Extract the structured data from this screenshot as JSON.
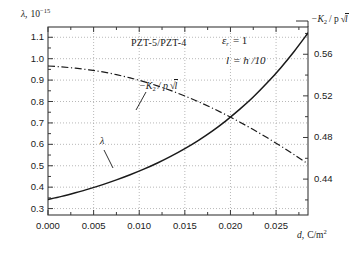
{
  "chart_data": {
    "type": "line",
    "title": "PZT-5/PZT-4",
    "annotations": {
      "material": "PZT-5/PZT-4",
      "param_epsilon": "ε",
      "param_epsilon_sub": "r",
      "param_epsilon_val": "= 1",
      "param_l": "l",
      "param_l_val": "= h /10",
      "curve_label_lambda": "λ",
      "curve_label_k2": "−K",
      "curve_label_k2_sub": "2",
      "curve_label_k2_rest": "/ p",
      "curve_label_k2_sqrt": "l"
    },
    "xlabel_main": "d,",
    "xlabel_unit": "C/m",
    "xlabel_unit_sup": "2",
    "xlim": [
      0.0,
      0.0285
    ],
    "xticks": [
      0.0,
      0.005,
      0.01,
      0.015,
      0.02,
      0.025
    ],
    "xtick_labels": [
      "0.000",
      "0.005",
      "0.010",
      "0.015",
      "0.020",
      "0.025"
    ],
    "left_axis": {
      "label_symbol": "λ,",
      "label_scale_base": "10",
      "label_scale_exp": "−15",
      "ylim": [
        0.27,
        1.148
      ],
      "ticks": [
        0.3,
        0.4,
        0.5,
        0.6,
        0.7,
        0.8,
        0.9,
        1.0,
        1.1
      ],
      "tick_labels": [
        "0.3",
        "0.4",
        "0.5",
        "0.6",
        "0.7",
        "0.8",
        "0.9",
        "1.0",
        "1.1"
      ]
    },
    "right_axis": {
      "label_prefix": "−K",
      "label_sub": "2",
      "label_mid": "/ p",
      "label_sqrt": "l",
      "ylim": [
        0.4055,
        0.5862
      ],
      "ticks": [
        0.44,
        0.48,
        0.52,
        0.56
      ],
      "tick_labels": [
        "0.44",
        "0.48",
        "0.52",
        "0.56"
      ]
    },
    "grid": true,
    "legend_position": "inline-annotations",
    "series": [
      {
        "name": "lambda",
        "axis": "left",
        "style": "solid",
        "color": "#1a1a1a",
        "x": [
          0.0,
          0.0015,
          0.003,
          0.0045,
          0.006,
          0.0075,
          0.009,
          0.0105,
          0.012,
          0.0135,
          0.015,
          0.0165,
          0.018,
          0.0195,
          0.021,
          0.0225,
          0.024,
          0.0255,
          0.027,
          0.0285
        ],
        "y": [
          0.342,
          0.357,
          0.374,
          0.392,
          0.412,
          0.434,
          0.458,
          0.484,
          0.513,
          0.545,
          0.58,
          0.619,
          0.662,
          0.71,
          0.763,
          0.821,
          0.886,
          0.957,
          1.035,
          1.12
        ]
      },
      {
        "name": "minus_K2_over_p_sqrt_l",
        "axis": "right",
        "style": "dashdot",
        "color": "#1a1a1a",
        "x": [
          0.0,
          0.0015,
          0.003,
          0.0045,
          0.006,
          0.0075,
          0.009,
          0.0105,
          0.012,
          0.0135,
          0.015,
          0.0165,
          0.018,
          0.0195,
          0.021,
          0.0225,
          0.024,
          0.0255,
          0.027,
          0.0285
        ],
        "y": [
          0.5487,
          0.5478,
          0.5466,
          0.545,
          0.543,
          0.5404,
          0.5373,
          0.5337,
          0.5296,
          0.525,
          0.5199,
          0.5143,
          0.5083,
          0.5018,
          0.4949,
          0.4876,
          0.4799,
          0.4718,
          0.4634,
          0.4546
        ]
      }
    ]
  }
}
